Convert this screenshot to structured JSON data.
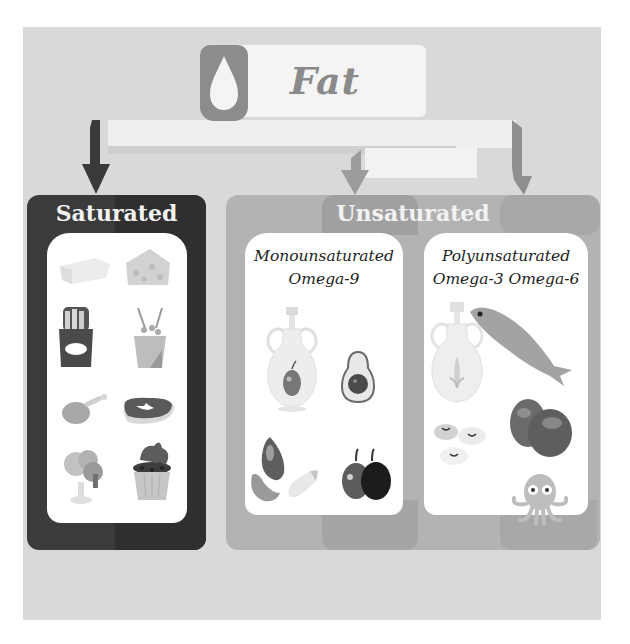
{
  "diagram": {
    "root": {
      "title": "Fat",
      "icon": "droplet-icon"
    },
    "categories": [
      {
        "label": "Saturated",
        "color": "#3b3b3b",
        "foods": [
          "butter-icon",
          "cheese-icon",
          "french-fries-icon",
          "popcorn-icon",
          "chicken-leg-icon",
          "steak-icon",
          "ice-cream-icon",
          "cupcake-icon"
        ]
      },
      {
        "label": "Unsaturated",
        "color": "#b3b3b3",
        "subcategories": [
          {
            "label_line1": "Monounsaturated",
            "label_line2": "Omega-9",
            "foods": [
              "olive-oil-bottle-icon",
              "avocado-icon",
              "almonds-icon",
              "olives-icon"
            ]
          },
          {
            "label_line1": "Polyunsaturated",
            "label_line2": "Omega-3 Omega-6",
            "foods": [
              "corn-oil-bottle-icon",
              "fish-icon",
              "beans-icon",
              "nuts-icon",
              "octopus-icon"
            ]
          }
        ]
      }
    ]
  },
  "colors": {
    "background": "#d9d9d9",
    "saturated": "#3b3b3b",
    "unsaturated": "#b3b3b3",
    "header": "#f4f4f4",
    "fat_text": "#8a8a8a"
  }
}
